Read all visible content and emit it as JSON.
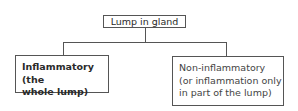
{
  "diagram": {
    "root": {
      "label": "Lump in gland"
    },
    "children": [
      {
        "line1": "Inflammatory (the",
        "line2": "whole lump)",
        "style": "bold"
      },
      {
        "line1": "Non-inflammatory",
        "line2": "(or inflammation only",
        "line3": "in part of the lump)",
        "style": "regular"
      }
    ],
    "colors": {
      "border": "#555555",
      "text": "#2a2a2a",
      "background": "#ffffff"
    }
  }
}
